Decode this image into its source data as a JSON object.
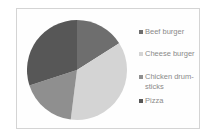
{
  "chart_data": {
    "type": "pie",
    "title": "",
    "categories": [
      "Beef burger",
      "Cheese burger",
      "Chicken drum-sticks",
      "Pizza"
    ],
    "values": [
      16,
      36,
      18,
      30
    ],
    "unit": "percent (estimated)",
    "colors": [
      "#6e6e6e",
      "#d4d4d4",
      "#8f8f8f",
      "#575757"
    ],
    "start_angle_deg": 0,
    "direction": "clockwise",
    "legend_position": "right"
  },
  "legend": {
    "items": [
      {
        "label": "Beef burger",
        "color": "#6e6e6e"
      },
      {
        "label": "Cheese burger",
        "color": "#d4d4d4"
      },
      {
        "label": "Chicken drum-\nsticks",
        "color": "#8f8f8f"
      },
      {
        "label": "Pizza",
        "color": "#575757"
      }
    ]
  }
}
